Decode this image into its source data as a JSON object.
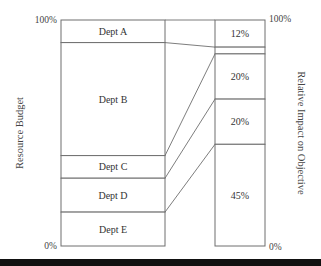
{
  "chart_data": {
    "type": "stacked-bar-comparison",
    "left_axis": {
      "label": "Resource Budget",
      "top_tick": "100%",
      "bottom_tick": "0%"
    },
    "right_axis": {
      "label": "Relative Impact on Objective",
      "top_tick": "100%",
      "bottom_tick": "0%"
    },
    "left_bar": {
      "segments": [
        {
          "name": "Dept A",
          "value": 10
        },
        {
          "name": "Dept B",
          "value": 50
        },
        {
          "name": "Dept C",
          "value": 10
        },
        {
          "name": "Dept D",
          "value": 15
        },
        {
          "name": "Dept E",
          "value": 15
        }
      ]
    },
    "right_bar": {
      "segments": [
        {
          "name": "Dept A",
          "value": 12,
          "label": "12%"
        },
        {
          "name": "Dept B",
          "value": 3,
          "label": ""
        },
        {
          "name": "Dept C",
          "value": 20,
          "label": "20%"
        },
        {
          "name": "Dept D",
          "value": 20,
          "label": "20%"
        },
        {
          "name": "Dept E",
          "value": 45,
          "label": "45%"
        }
      ]
    },
    "ylim": [
      0,
      100
    ]
  }
}
